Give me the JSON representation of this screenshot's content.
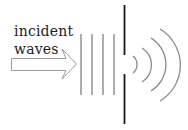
{
  "diagram": {
    "type": "single-slit diffraction",
    "label_lines": [
      "incident",
      "waves"
    ],
    "colors": {
      "barrier": "#1a1a1a",
      "wavefronts": "#8a8a8a",
      "arrow": "#9a9a9a",
      "text": "#222222"
    },
    "incident_wavefronts_x": [
      81,
      92,
      103,
      114
    ],
    "diffracted_arcs": 4
  }
}
